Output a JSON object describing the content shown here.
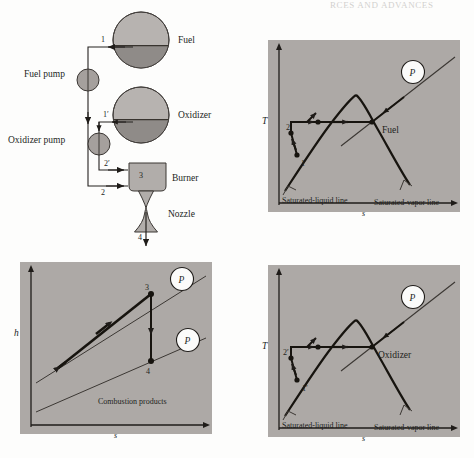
{
  "header": {
    "text": "RCES AND ADVANCES"
  },
  "figure": {
    "colors": {
      "panel_bg": "#ada9a6",
      "page_bg": "#fdfdfc",
      "tank_vapor": "#b7b3b0",
      "tank_liquid": "#8f8b88",
      "component_fill": "#b1adaa",
      "stroke_dark": "#1f1c19",
      "stroke_thin": "#55514d",
      "marker_white": "#fbfbfa"
    }
  },
  "schematic": {
    "name": "rocket-engine-schematic",
    "tanks": [
      {
        "id": "fuel-tank",
        "label": "Fuel",
        "cx": 141,
        "cy": 40,
        "r": 28
      },
      {
        "id": "oxidizer-tank",
        "label": "Oxidizer",
        "cx": 141,
        "cy": 115,
        "r": 28
      }
    ],
    "pumps": [
      {
        "id": "fuel-pump",
        "label": "Fuel pump",
        "cx": 88,
        "cy": 80,
        "r": 11
      },
      {
        "id": "oxidizer-pump",
        "label": "Oxidizer pump",
        "cx": 99,
        "cy": 144,
        "r": 11
      }
    ],
    "components": [
      {
        "id": "burner",
        "label": "Burner",
        "state": "3"
      },
      {
        "id": "nozzle",
        "label": "Nozzle"
      }
    ],
    "state_points": [
      {
        "id": "state-1",
        "label": "1"
      },
      {
        "id": "state-1-prime",
        "label": "1′"
      },
      {
        "id": "state-2",
        "label": "2"
      },
      {
        "id": "state-2-prime",
        "label": "2′"
      },
      {
        "id": "state-3",
        "label": "3"
      },
      {
        "id": "state-4",
        "label": "4"
      }
    ]
  },
  "panels": [
    {
      "id": "ts-fuel",
      "name": "ts-diagram-fuel",
      "x": 268,
      "y": 40,
      "w": 192,
      "h": 172,
      "axis_y": "T",
      "axis_x": "s",
      "substance": "Fuel",
      "pressure_marker": "P",
      "labels": {
        "sat_liquid": "Saturated-liquid line",
        "sat_vapor": "Saturated-vapor line"
      },
      "state_points": [
        {
          "label": "1",
          "x": 297,
          "y": 160
        },
        {
          "label": "2",
          "x": 290,
          "y": 131
        }
      ]
    },
    {
      "id": "hs-combustion",
      "name": "hs-diagram-combustion-products",
      "x": 20,
      "y": 262,
      "w": 192,
      "h": 172,
      "axis_y": "h",
      "axis_x": "s",
      "substance": "Combustion products",
      "pressure_marker": "P",
      "state_points": [
        {
          "label": "3",
          "x": 151,
          "y": 293
        },
        {
          "label": "4",
          "x": 151,
          "y": 361
        }
      ]
    },
    {
      "id": "ts-oxidizer",
      "name": "ts-diagram-oxidizer",
      "x": 268,
      "y": 265,
      "w": 192,
      "h": 172,
      "axis_y": "T",
      "axis_x": "s",
      "substance": "Oxidizer",
      "pressure_marker": "P",
      "labels": {
        "sat_liquid": "Saturated-liquid line",
        "sat_vapor": "Saturated-vapor line"
      },
      "state_points": [
        {
          "label": "1′",
          "x": 299,
          "y": 385
        },
        {
          "label": "2′",
          "x": 289,
          "y": 352
        }
      ]
    }
  ]
}
